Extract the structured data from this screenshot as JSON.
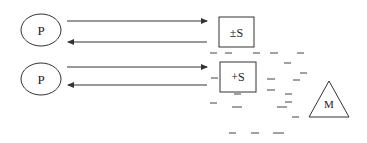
{
  "diagram": {
    "nodes": {
      "p1": {
        "label": "P",
        "shape": "ellipse"
      },
      "p2": {
        "label": "P",
        "shape": "ellipse"
      },
      "s1": {
        "label": "±S",
        "shape": "rectangle"
      },
      "s2": {
        "label": "+S",
        "shape": "rectangle"
      },
      "m": {
        "label": "M",
        "shape": "triangle"
      }
    },
    "edges": [
      {
        "from": "p1",
        "to": "s1",
        "direction": "right"
      },
      {
        "from": "s1",
        "to": "p1",
        "direction": "left"
      },
      {
        "from": "p2",
        "to": "s2",
        "direction": "right"
      },
      {
        "from": "s2",
        "to": "p2",
        "direction": "left"
      }
    ],
    "charge_marks": "-",
    "colors": {
      "stroke": "#333333",
      "background": "#ffffff"
    }
  }
}
